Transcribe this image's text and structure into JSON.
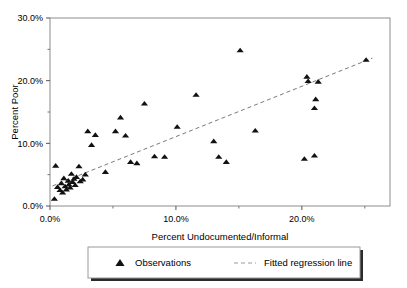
{
  "chart_data": {
    "type": "scatter",
    "title": "",
    "xlabel": "Percent Undocumented/Informal",
    "ylabel": "Percent Poor",
    "xlim": [
      0,
      27
    ],
    "ylim": [
      0,
      30
    ],
    "xticks": [
      0,
      10,
      20
    ],
    "xticklabels": [
      "0.0%",
      "10.0%",
      "20.0%"
    ],
    "xticks_minor": [
      5,
      15,
      25
    ],
    "yticks": [
      0,
      10,
      20,
      30
    ],
    "yticklabels": [
      "0.0%",
      "10.0%",
      "20.0%",
      "30.0%"
    ],
    "yticks_minor": [
      5,
      15,
      25
    ],
    "grid": false,
    "legend_position": "bottom",
    "series": [
      {
        "name": "Observations",
        "marker": "triangle",
        "color": "#111111",
        "points": [
          [
            0.35,
            1.1
          ],
          [
            0.45,
            6.4
          ],
          [
            0.6,
            3.0
          ],
          [
            0.8,
            2.5
          ],
          [
            0.9,
            3.6
          ],
          [
            1.0,
            2.1
          ],
          [
            1.1,
            4.4
          ],
          [
            1.2,
            3.1
          ],
          [
            1.3,
            2.6
          ],
          [
            1.45,
            4.0
          ],
          [
            1.5,
            3.4
          ],
          [
            1.6,
            2.9
          ],
          [
            1.7,
            5.1
          ],
          [
            1.8,
            3.8
          ],
          [
            1.9,
            4.3
          ],
          [
            2.0,
            3.3
          ],
          [
            2.1,
            4.6
          ],
          [
            2.3,
            6.3
          ],
          [
            2.4,
            3.9
          ],
          [
            2.6,
            4.2
          ],
          [
            2.8,
            5.0
          ],
          [
            3.0,
            11.9
          ],
          [
            3.3,
            9.7
          ],
          [
            3.6,
            11.3
          ],
          [
            4.4,
            5.4
          ],
          [
            5.2,
            11.9
          ],
          [
            5.6,
            14.1
          ],
          [
            6.0,
            11.2
          ],
          [
            6.4,
            7.0
          ],
          [
            6.9,
            6.8
          ],
          [
            7.5,
            16.3
          ],
          [
            8.3,
            7.9
          ],
          [
            9.1,
            7.8
          ],
          [
            10.1,
            12.6
          ],
          [
            11.6,
            17.7
          ],
          [
            13.0,
            10.3
          ],
          [
            13.4,
            7.8
          ],
          [
            14.0,
            7.0
          ],
          [
            15.1,
            24.8
          ],
          [
            16.3,
            12.0
          ],
          [
            20.2,
            7.5
          ],
          [
            20.4,
            20.6
          ],
          [
            20.5,
            19.9
          ],
          [
            21.0,
            8.0
          ],
          [
            21.3,
            19.8
          ],
          [
            21.1,
            17.0
          ],
          [
            21.0,
            15.6
          ],
          [
            25.1,
            23.3
          ]
        ]
      }
    ],
    "fit_line": {
      "name": "Fitted regression line",
      "style": "dashed",
      "color": "#7a7a7a",
      "x_start": 0.2,
      "y_start": 3.2,
      "x_end": 25.6,
      "y_end": 23.6
    },
    "legend": [
      {
        "label": "Observations",
        "symbol": "triangle"
      },
      {
        "label": "Fitted regression line",
        "symbol": "dashed-line"
      }
    ]
  }
}
